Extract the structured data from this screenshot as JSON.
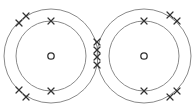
{
  "diagram": {
    "type": "dot-and-cross covalent bonding diagram",
    "colors": {
      "shell": "#8a8a8a",
      "electron": "#333333",
      "background": "#ffffff"
    },
    "atoms": [
      {
        "id": "left-atom",
        "center": [
          51,
          56
        ],
        "inner_shell_radius": 35,
        "outer_shell_radius": 47,
        "nucleus_radius": 3.2,
        "electrons": [
          {
            "shell": "inner",
            "pos": [
              51,
              21
            ]
          },
          {
            "shell": "inner",
            "pos": [
              51,
              91
            ]
          },
          {
            "shell": "outer",
            "pos": [
              19,
              23
            ]
          },
          {
            "shell": "outer",
            "pos": [
              26,
              16
            ]
          },
          {
            "shell": "outer",
            "pos": [
              19,
              90
            ]
          },
          {
            "shell": "outer",
            "pos": [
              26,
              97
            ]
          }
        ]
      },
      {
        "id": "right-atom",
        "center": [
          144,
          56
        ],
        "inner_shell_radius": 35,
        "outer_shell_radius": 47,
        "nucleus_radius": 3.2,
        "electrons": [
          {
            "shell": "inner",
            "pos": [
              144,
              21
            ]
          },
          {
            "shell": "inner",
            "pos": [
              144,
              91
            ]
          },
          {
            "shell": "outer",
            "pos": [
              170,
              15
            ]
          },
          {
            "shell": "outer",
            "pos": [
              177,
              21
            ]
          },
          {
            "shell": "outer",
            "pos": [
              170,
              97
            ]
          },
          {
            "shell": "outer",
            "pos": [
              177,
              91
            ]
          }
        ]
      }
    ],
    "shared_electrons": [
      {
        "pos": [
          97,
          42
        ]
      },
      {
        "pos": [
          97,
          50
        ]
      },
      {
        "pos": [
          97,
          57
        ]
      },
      {
        "pos": [
          97,
          65
        ]
      }
    ],
    "electron_symbol": "cross",
    "cross_half_size": 3
  }
}
